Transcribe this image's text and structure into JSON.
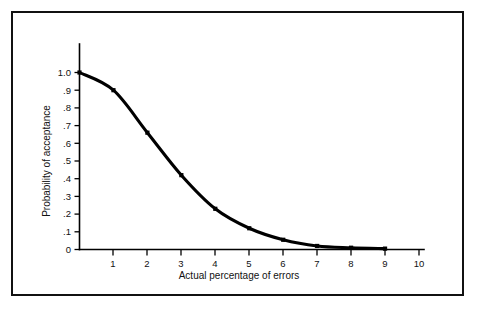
{
  "figure": {
    "background_color": "#ffffff",
    "frame_color": "#111111",
    "curve_color": "#000000"
  },
  "chart_data": {
    "type": "line",
    "title": "",
    "subtitle": "",
    "xlabel": "Actual percentage of errors",
    "ylabel": "Probability of acceptance",
    "xlim": [
      0,
      10
    ],
    "ylim": [
      0,
      1.0
    ],
    "grid": false,
    "legend": null,
    "x": [
      0,
      1,
      2,
      3,
      4,
      5,
      6,
      7,
      8,
      9
    ],
    "values": [
      1.0,
      0.9,
      0.66,
      0.42,
      0.23,
      0.12,
      0.055,
      0.02,
      0.01,
      0.005
    ],
    "series": [
      {
        "name": "Operating characteristic curve",
        "values": [
          1.0,
          0.9,
          0.66,
          0.42,
          0.23,
          0.12,
          0.055,
          0.02,
          0.01,
          0.005
        ]
      }
    ],
    "markers": "square",
    "xticks": [
      0,
      1,
      2,
      3,
      4,
      5,
      6,
      7,
      8,
      9,
      10
    ],
    "xticklabels": [
      "",
      "1",
      "2",
      "3",
      "4",
      "5",
      "6",
      "7",
      "8",
      "9",
      "10"
    ],
    "yticks": [
      0,
      0.1,
      0.2,
      0.3,
      0.4,
      0.5,
      0.6,
      0.7,
      0.8,
      0.9,
      1.0
    ],
    "yticklabels": [
      "0",
      ".1",
      ".2",
      ".3",
      ".4",
      ".5",
      ".6",
      ".7",
      ".8",
      ".9",
      "1.0"
    ]
  }
}
